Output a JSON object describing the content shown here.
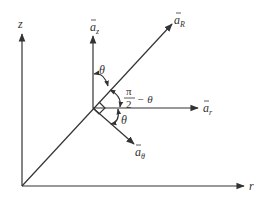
{
  "diagram": {
    "type": "vector-decomposition",
    "axes": {
      "vertical": {
        "label": "z"
      },
      "horizontal": {
        "label": "r"
      }
    },
    "vectors": [
      {
        "name": "a_z",
        "base": "a",
        "subscript": "z",
        "direction": "up"
      },
      {
        "name": "a_R",
        "base": "a",
        "subscript": "R",
        "direction": "radial"
      },
      {
        "name": "a_r",
        "base": "a",
        "subscript": "r",
        "direction": "right"
      },
      {
        "name": "a_theta",
        "base": "a",
        "subscript": "θ",
        "direction": "down-right"
      }
    ],
    "angles": [
      {
        "label": "θ",
        "between": "a_z and a_R"
      },
      {
        "label_numerator": "π",
        "label_denominator": "2",
        "label_suffix": "− θ",
        "between": "a_R and a_r"
      },
      {
        "label": "θ",
        "between": "a_r and a_theta"
      }
    ],
    "colors": {
      "ink": "#333333",
      "background": "#ffffff"
    }
  }
}
